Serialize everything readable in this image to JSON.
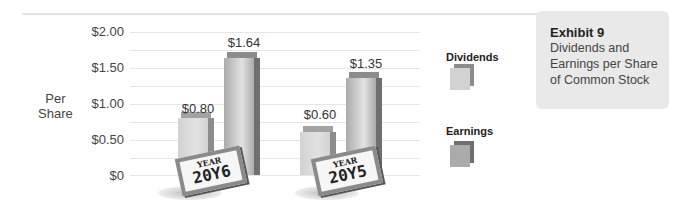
{
  "chart_data": {
    "type": "bar",
    "title": "Exhibit 9",
    "subtitle": "Dividends and Earnings per Share of Common Stock",
    "xlabel": "",
    "ylabel": "Per Share",
    "ylim": [
      0,
      2.0
    ],
    "yticks": [
      "$0",
      "$0.50",
      "$1.00",
      "$1.50",
      "$2.00"
    ],
    "categories": [
      "YEAR 20Y6",
      "YEAR 20Y5"
    ],
    "series": [
      {
        "name": "Dividends",
        "values": [
          0.8,
          0.6
        ],
        "labels": [
          "$0.80",
          "$0.60"
        ],
        "color": "#cfcfcf"
      },
      {
        "name": "Earnings",
        "values": [
          1.64,
          1.35
        ],
        "labels": [
          "$1.64",
          "$1.35"
        ],
        "color": "#a9a9a9"
      }
    ],
    "grid": true,
    "legend_position": "right"
  },
  "axis": {
    "ylabel_line1": "Per",
    "ylabel_line2": "Share",
    "ticks": [
      "$2.00",
      "$1.50",
      "$1.00",
      "$0.50",
      "$0"
    ]
  },
  "groups": [
    {
      "year_word": "YEAR",
      "year": "20Y6",
      "div_label": "$0.80",
      "earn_label": "$1.64"
    },
    {
      "year_word": "YEAR",
      "year": "20Y5",
      "div_label": "$0.60",
      "earn_label": "$1.35"
    }
  ],
  "legend": {
    "dividends": "Dividends",
    "earnings": "Earnings"
  },
  "exhibit": {
    "title": "Exhibit 9",
    "description": "Dividends and Earnings per Share of Common Stock"
  },
  "colors": {
    "dividends_front": "#d2d2d2",
    "dividends_side": "#8c8c8c",
    "earnings_front": "#ababab",
    "earnings_side": "#6f6f6f",
    "panel_bg": "#e9e9e9"
  }
}
